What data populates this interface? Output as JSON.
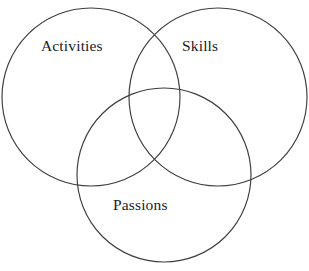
{
  "diagram": {
    "type": "venn",
    "background_color": "#ffffff",
    "stroke_color": "#3d3d42",
    "text_color": "#1b1b1f",
    "sets": [
      {
        "id": "activities",
        "label": "Activities",
        "position": "top-left",
        "center_x": 91,
        "center_y": 97,
        "radius": 89
      },
      {
        "id": "skills",
        "label": "Skills",
        "position": "top-right",
        "center_x": 218,
        "center_y": 97,
        "radius": 89
      },
      {
        "id": "passions",
        "label": "Passions",
        "position": "bottom-center",
        "center_x": 164,
        "center_y": 175,
        "radius": 87
      }
    ]
  }
}
